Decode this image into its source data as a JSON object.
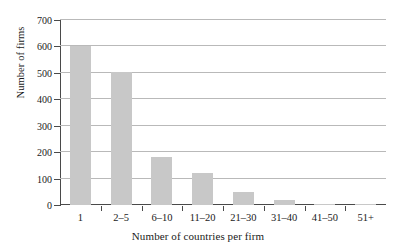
{
  "chart_data": {
    "type": "bar",
    "title": "",
    "subtitle": "",
    "xlabel": "Number of countries per firm",
    "ylabel": "Number of firms",
    "categories": [
      "1",
      "2–5",
      "6–10",
      "11–20",
      "21–30",
      "31–40",
      "41–50",
      "51+"
    ],
    "values": [
      600,
      503,
      180,
      120,
      50,
      20,
      5,
      4
    ],
    "series": [
      {
        "name": "Number of firms",
        "values": [
          600,
          503,
          180,
          120,
          50,
          20,
          5,
          4
        ]
      }
    ],
    "ylim": [
      0,
      700
    ],
    "yticks": [
      0,
      100,
      200,
      300,
      400,
      500,
      600,
      700
    ],
    "ytick_labels": [
      "0",
      "100",
      "200",
      "300",
      "400",
      "500",
      "600",
      "700"
    ],
    "grid": "horizontal",
    "legend": "none",
    "bar_color": "#c8c8c8",
    "axis_color": "#4a4a4a",
    "grid_color": "#b9b9b9",
    "background": "#ffffff",
    "annotations": []
  }
}
